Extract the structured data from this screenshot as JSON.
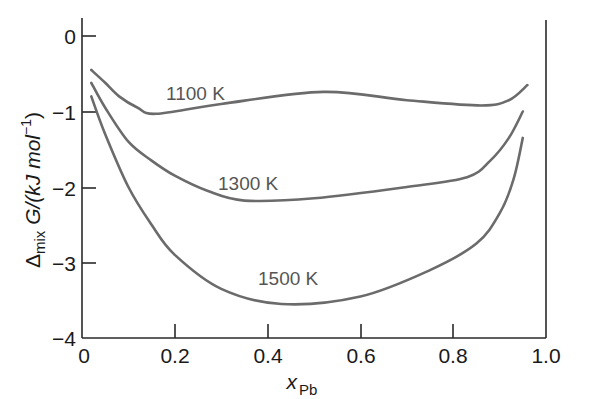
{
  "chart_data": {
    "type": "line",
    "title": "",
    "xlabel": "x_Pb",
    "ylabel": "Δmix G/(kJ mol⁻¹)",
    "xlim": [
      0,
      1.0
    ],
    "ylim": [
      -4,
      0
    ],
    "x_ticks": [
      "0",
      "0.2",
      "0.4",
      "0.6",
      "0.8",
      "1.0"
    ],
    "y_ticks": [
      "0",
      "−1",
      "−2",
      "−3",
      "−4"
    ],
    "grid": false,
    "legend": "inline labels",
    "series": [
      {
        "name": "1100 K",
        "x": [
          0.02,
          0.05,
          0.08,
          0.12,
          0.16,
          0.3,
          0.52,
          0.7,
          0.86,
          0.92,
          0.96
        ],
        "values": [
          -0.45,
          -0.62,
          -0.8,
          -0.95,
          -1.03,
          -0.9,
          -0.74,
          -0.85,
          -0.92,
          -0.85,
          -0.65
        ]
      },
      {
        "name": "1300 K",
        "x": [
          0.02,
          0.05,
          0.1,
          0.15,
          0.2,
          0.27,
          0.35,
          0.5,
          0.7,
          0.83,
          0.88,
          0.92,
          0.95
        ],
        "values": [
          -0.62,
          -0.95,
          -1.4,
          -1.65,
          -1.85,
          -2.05,
          -2.18,
          -2.15,
          -2.0,
          -1.87,
          -1.65,
          -1.35,
          -1.0
        ]
      },
      {
        "name": "1500 K",
        "x": [
          0.02,
          0.05,
          0.1,
          0.15,
          0.2,
          0.3,
          0.43,
          0.6,
          0.75,
          0.85,
          0.9,
          0.93,
          0.95
        ],
        "values": [
          -0.8,
          -1.3,
          -2.0,
          -2.5,
          -2.9,
          -3.35,
          -3.55,
          -3.45,
          -3.1,
          -2.75,
          -2.35,
          -1.9,
          -1.35
        ]
      }
    ]
  },
  "labels": {
    "y0": "0",
    "y1": "−1",
    "y2": "−2",
    "y3": "−3",
    "y4": "−4",
    "x0": "0",
    "x1": "0.2",
    "x2": "0.4",
    "x3": "0.6",
    "x4": "0.8",
    "x5": "1.0",
    "curve1100": "1100 K",
    "curve1300": "1300 K",
    "curve1500": "1500 K",
    "ylabel_delta": "Δ",
    "ylabel_sub": "mix",
    "ylabel_main": " G/(kJ mol",
    "ylabel_sup": "−1",
    "ylabel_end": ")",
    "xlabel_main": "x",
    "xlabel_sub": "Pb"
  },
  "colors": {
    "curve": "#6b6b6b",
    "axis": "#2a2a2a"
  }
}
